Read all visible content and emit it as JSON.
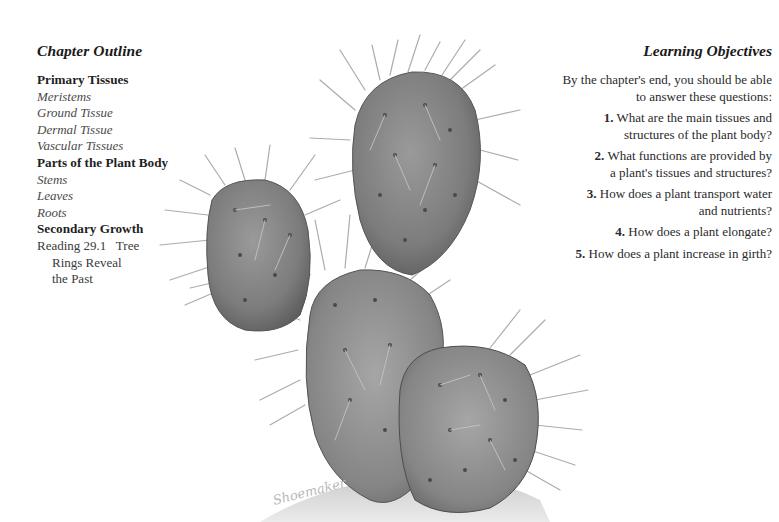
{
  "chapter_outline": {
    "title": "Chapter Outline",
    "sections": [
      {
        "label": "Primary Tissues",
        "subitems": [
          "Meristems",
          "Ground Tissue",
          "Dermal Tissue",
          "Vascular Tissues"
        ]
      },
      {
        "label": "Parts of the Plant Body",
        "subitems": [
          "Stems",
          "Leaves",
          "Roots"
        ]
      },
      {
        "label": "Secondary Growth",
        "subitems": []
      }
    ],
    "reading": {
      "line1": "Reading 29.1   Tree",
      "line2": "Rings Reveal",
      "line3": "the Past"
    }
  },
  "learning_objectives": {
    "title": "Learning Objectives",
    "intro_line1": "By the chapter's end, you should be able",
    "intro_line2": "to answer these questions:",
    "questions": [
      {
        "num": "1.",
        "line1": "What are the main tissues and",
        "line2": "structures of the plant body?"
      },
      {
        "num": "2.",
        "line1": "What functions are provided by",
        "line2": "a plant's tissues and structures?"
      },
      {
        "num": "3.",
        "line1": "How does a plant transport water",
        "line2": "and nutrients?"
      },
      {
        "num": "4.",
        "line1": "How does a plant elongate?",
        "line2": ""
      },
      {
        "num": "5.",
        "line1": "How does a plant increase in girth?",
        "line2": ""
      }
    ]
  },
  "illustration": {
    "subject": "prickly pear cactus (pencil drawing)",
    "signature": "Shoemaker"
  }
}
